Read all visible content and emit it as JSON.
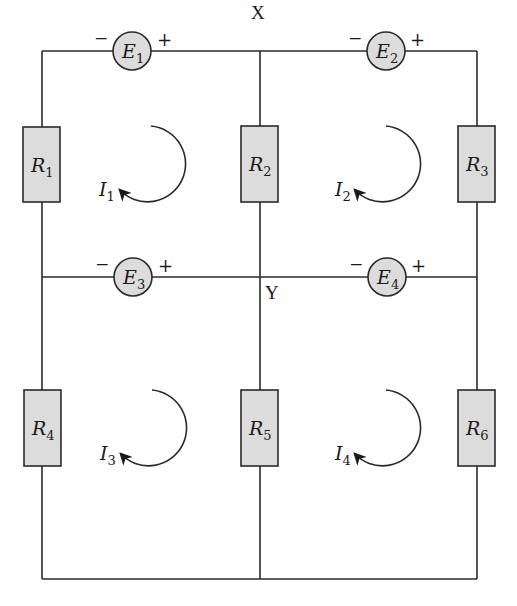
{
  "diagram": {
    "type": "circuit",
    "nodes": [
      {
        "id": "X",
        "label": "X"
      },
      {
        "id": "Y",
        "label": "Y"
      }
    ],
    "sources": [
      {
        "id": "E1",
        "main": "E",
        "sub": "1",
        "neg": "−",
        "pos": "+"
      },
      {
        "id": "E2",
        "main": "E",
        "sub": "2",
        "neg": "−",
        "pos": "+"
      },
      {
        "id": "E3",
        "main": "E",
        "sub": "3",
        "neg": "−",
        "pos": "+"
      },
      {
        "id": "E4",
        "main": "E",
        "sub": "4",
        "neg": "−",
        "pos": "+"
      }
    ],
    "resistors": [
      {
        "id": "R1",
        "main": "R",
        "sub": "1"
      },
      {
        "id": "R2",
        "main": "R",
        "sub": "2"
      },
      {
        "id": "R3",
        "main": "R",
        "sub": "3"
      },
      {
        "id": "R4",
        "main": "R",
        "sub": "4"
      },
      {
        "id": "R5",
        "main": "R",
        "sub": "5"
      },
      {
        "id": "R6",
        "main": "R",
        "sub": "6"
      }
    ],
    "mesh_currents": [
      {
        "id": "I1",
        "main": "I",
        "sub": "1",
        "direction": "clockwise"
      },
      {
        "id": "I2",
        "main": "I",
        "sub": "2",
        "direction": "clockwise"
      },
      {
        "id": "I3",
        "main": "I",
        "sub": "3",
        "direction": "clockwise"
      },
      {
        "id": "I4",
        "main": "I",
        "sub": "4",
        "direction": "clockwise"
      }
    ],
    "colors": {
      "wire": "#2a2a2a",
      "component_fill": "#dcdcdc",
      "background": "#ffffff"
    }
  }
}
